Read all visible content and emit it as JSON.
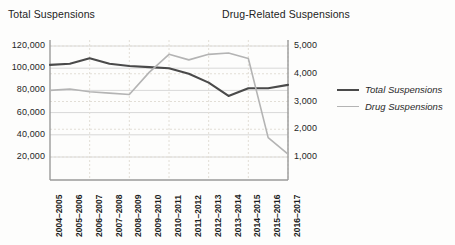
{
  "header": {
    "left_title": "Total Suspensions",
    "right_title": "Drug-Related Suspensions"
  },
  "legend": {
    "position": "right",
    "items": [
      {
        "label": "Total Suspensions",
        "color": "#4a4a4a"
      },
      {
        "label": "Drug Suspensions",
        "color": "#b4b4b4"
      }
    ]
  },
  "colors": {
    "total_line": "#4a4a4a",
    "drug_line": "#b4b4b4",
    "gridline": "#d8d8d8",
    "gridline_dashed": "#e2ded6",
    "axis": "#9a9a9a",
    "text": "#232323",
    "background": "#fdfdfc"
  },
  "axes": {
    "left": {
      "title": "Total Suspensions",
      "ticks": [
        "20,000",
        "40,000",
        "60,000",
        "80,000",
        "100,000",
        "120,000"
      ],
      "values": [
        20000,
        40000,
        60000,
        80000,
        100000,
        120000
      ],
      "min": 0,
      "max": 120000
    },
    "right": {
      "title": "Drug-Related Suspensions",
      "ticks": [
        "1,000",
        "2,000",
        "3,000",
        "4,000",
        "5,000"
      ],
      "values": [
        1000,
        2000,
        3000,
        4000,
        5000
      ],
      "min": 0,
      "max": 5000
    },
    "x": {
      "ticks": [
        "2004–2005",
        "2005–2006",
        "2006–2007",
        "2007–2008",
        "2008–2009",
        "2009–2010",
        "2010–2011",
        "2011–2012",
        "2012–2013",
        "2013–2014",
        "2014–2015",
        "2015–2016",
        "2016–2017"
      ]
    }
  },
  "chart_data": {
    "type": "line",
    "title": "",
    "xlabel": "",
    "ylabel": "Total Suspensions",
    "y2label": "Drug-Related Suspensions",
    "categories": [
      "2004–2005",
      "2005–2006",
      "2006–2007",
      "2007–2008",
      "2008–2009",
      "2009–2010",
      "2010–2011",
      "2011–2012",
      "2012–2013",
      "2013–2014",
      "2014–2015",
      "2015–2016",
      "2016–2017"
    ],
    "grid": true,
    "legend_position": "right",
    "ylim": [
      0,
      120000
    ],
    "y2lim": [
      0,
      5000
    ],
    "series": [
      {
        "name": "Total Suspensions",
        "axis": "left",
        "color": "#4a4a4a",
        "values": [
          103000,
          104000,
          109000,
          104000,
          102000,
          101000,
          100000,
          95000,
          87000,
          75000,
          82000,
          82000,
          85000
        ]
      },
      {
        "name": "Drug Suspensions",
        "axis": "right",
        "color": "#b4b4b4",
        "values": [
          3400,
          3450,
          3350,
          3300,
          3250,
          4050,
          4700,
          4500,
          4700,
          4750,
          4550,
          1700,
          1100
        ]
      }
    ]
  }
}
